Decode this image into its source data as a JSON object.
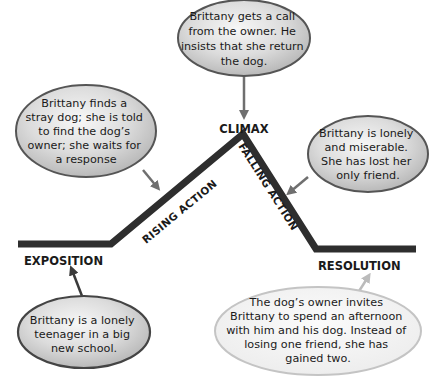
{
  "diagram": {
    "type": "plot-diagram",
    "colors": {
      "line": "#2e2e2e",
      "bubble_fill_light": "#f4f4f4",
      "bubble_fill_dark": "#bdbdbd",
      "bubble_border": "#555555",
      "arrow": "#6f6f6f",
      "resolution_bubble_fill": "#f6f6f6",
      "resolution_bubble_border": "#bdbdbd",
      "resolution_arrow": "#bbbbbb"
    },
    "stages": {
      "exposition": "EXPOSITION",
      "rising_action": "RISING ACTION",
      "climax": "CLIMAX",
      "falling_action": "FALLING ACTION",
      "resolution": "RESOLUTION"
    },
    "bubbles": {
      "climax": {
        "lines": [
          "Brittany gets a call",
          "from the owner. He",
          "insists that she return",
          "the dog."
        ]
      },
      "rising_action": {
        "lines": [
          "Brittany finds a",
          "stray dog; she is told",
          "to find the dog’s",
          "owner; she waits for",
          "a response"
        ]
      },
      "falling_action": {
        "lines": [
          "Brittany is lonely",
          "and miserable.",
          "She has lost her",
          "only friend."
        ]
      },
      "exposition": {
        "lines": [
          "Brittany is a lonely",
          "teenager in a big",
          "new school."
        ]
      },
      "resolution": {
        "lines": [
          "The dog’s owner invites",
          "Brittany to spend an afternoon",
          "with him and his dog. Instead of",
          "losing one friend, she has",
          "gained two."
        ]
      }
    }
  }
}
